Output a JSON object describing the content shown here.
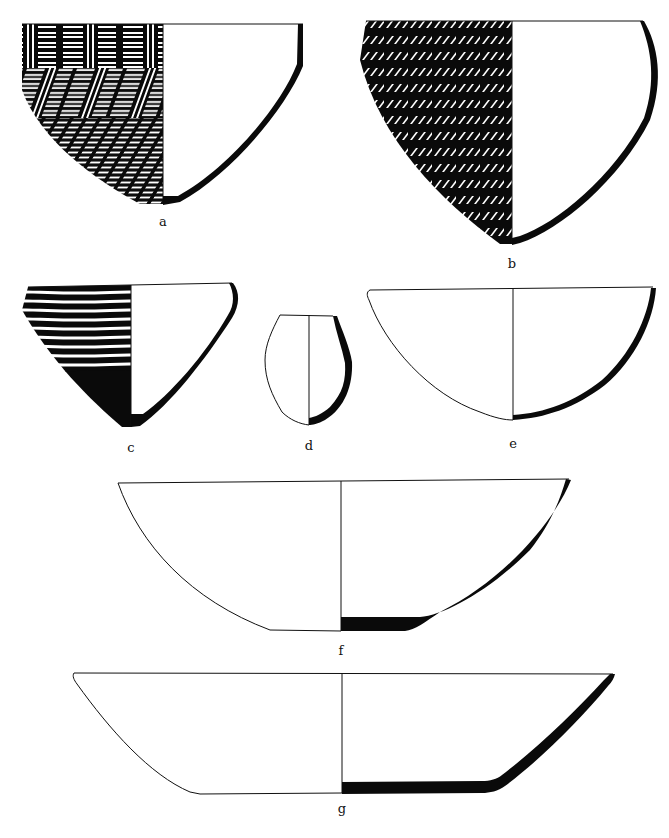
{
  "figure": {
    "type": "pottery-profile-plate",
    "background": "#ffffff",
    "ink": "#0a0a0a",
    "vessels": [
      {
        "id": "a",
        "label": "a",
        "form": "conical bowl",
        "decoration": "basketry/checkerboard stripe pattern on exterior",
        "rim_y": 24,
        "left_x": 22,
        "center_x": 163,
        "right_x": 303,
        "base_y": 204
      },
      {
        "id": "b",
        "label": "b",
        "form": "deep rounded bowl",
        "decoration": "herringbone pattern in horizontal bands on exterior",
        "rim_y": 21,
        "left_x": 360,
        "center_x": 512,
        "right_x": 643,
        "base_y": 244
      },
      {
        "id": "c",
        "label": "c",
        "form": "conical bowl",
        "decoration": "horizontal wavy lines, solid black lower body",
        "rim_y": 283,
        "left_x": 22,
        "center_x": 131,
        "right_x": 232,
        "base_y": 427
      },
      {
        "id": "d",
        "label": "d",
        "form": "small restricted jar",
        "decoration": "plain",
        "rim_y": 315,
        "left_x": 278,
        "center_x": 309,
        "right_x": 335,
        "base_y": 424
      },
      {
        "id": "e",
        "label": "e",
        "form": "hemispherical bowl",
        "decoration": "plain",
        "rim_y": 288,
        "left_x": 368,
        "center_x": 513,
        "right_x": 655,
        "base_y": 420
      },
      {
        "id": "f",
        "label": "f",
        "form": "wide shallow bowl with flat base",
        "decoration": "plain",
        "rim_y": 482,
        "left_x": 118,
        "center_x": 341,
        "right_x": 570,
        "base_y": 631
      },
      {
        "id": "g",
        "label": "g",
        "form": "shallow flat-based basin",
        "decoration": "plain",
        "rim_y": 673,
        "left_x": 73,
        "center_x": 342,
        "right_x": 614,
        "base_y": 794
      }
    ]
  }
}
